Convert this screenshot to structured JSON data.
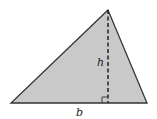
{
  "diagram": {
    "shape": "triangle",
    "vertices": {
      "apex": [
        108,
        10
      ],
      "bottom_left": [
        11,
        103
      ],
      "bottom_right": [
        147,
        103
      ]
    },
    "height_line": {
      "from": [
        108,
        10
      ],
      "to": [
        108,
        103
      ],
      "style": "dashed"
    },
    "right_angle_marker": {
      "x": 102,
      "y": 97,
      "size": 6
    },
    "labels": {
      "height": "h",
      "base": "b"
    },
    "colors": {
      "fill": "#c9c9c9",
      "stroke": "#333333",
      "dash": "#222222",
      "background": "#ffffff"
    }
  }
}
